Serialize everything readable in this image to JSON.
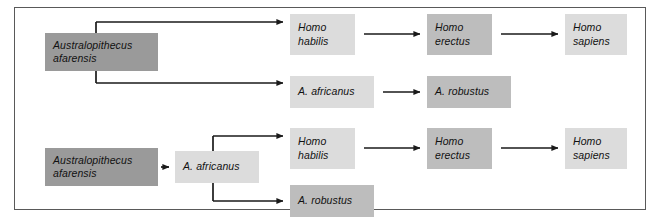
{
  "figure": {
    "caption": "",
    "colors": {
      "frame_border": "#595959",
      "background": "#ffffff",
      "box_dark": "#9a9a9a",
      "box_mid": "#bdbdbd",
      "box_light": "#dcdcdc",
      "arrow": "#1a1a1a",
      "text": "#111111"
    }
  },
  "hypotheses": [
    {
      "id": "upper",
      "nodes": [
        {
          "id": "u-afarensis",
          "label": "Australopithecus\nafarensis",
          "shade": "dark",
          "x": 45,
          "y": 33,
          "w": 113,
          "h": 38
        },
        {
          "id": "u-habilis",
          "label": "Homo\nhabilis",
          "shade": "light",
          "x": 290,
          "y": 14,
          "w": 65,
          "h": 41
        },
        {
          "id": "u-erectus",
          "label": "Homo\nerectus",
          "shade": "mid",
          "x": 427,
          "y": 14,
          "w": 65,
          "h": 41
        },
        {
          "id": "u-sapiens",
          "label": "Homo\nsapiens",
          "shade": "light",
          "x": 565,
          "y": 14,
          "w": 62,
          "h": 41
        },
        {
          "id": "u-africanus",
          "label": "A. africanus",
          "shade": "light",
          "x": 290,
          "y": 76,
          "w": 84,
          "h": 32
        },
        {
          "id": "u-robustus",
          "label": "A. robustus",
          "shade": "mid",
          "x": 427,
          "y": 76,
          "w": 84,
          "h": 32
        }
      ],
      "edges": [
        {
          "from": "u-afarensis",
          "to": "u-habilis",
          "style": "bracket-up"
        },
        {
          "from": "u-afarensis",
          "to": "u-africanus",
          "style": "bracket-down"
        },
        {
          "from": "u-habilis",
          "to": "u-erectus",
          "style": "straight"
        },
        {
          "from": "u-erectus",
          "to": "u-sapiens",
          "style": "straight"
        },
        {
          "from": "u-africanus",
          "to": "u-robustus",
          "style": "straight"
        }
      ]
    },
    {
      "id": "lower",
      "nodes": [
        {
          "id": "l-afarensis",
          "label": "Australopithecus\nafarensis",
          "shade": "dark",
          "x": 45,
          "y": 148,
          "w": 113,
          "h": 38
        },
        {
          "id": "l-africanus",
          "label": "A. africanus",
          "shade": "light",
          "x": 175,
          "y": 151,
          "w": 84,
          "h": 32
        },
        {
          "id": "l-habilis",
          "label": "Homo\nhabilis",
          "shade": "light",
          "x": 290,
          "y": 128,
          "w": 65,
          "h": 41
        },
        {
          "id": "l-erectus",
          "label": "Homo\nerectus",
          "shade": "mid",
          "x": 427,
          "y": 128,
          "w": 65,
          "h": 41
        },
        {
          "id": "l-sapiens",
          "label": "Homo\nsapiens",
          "shade": "light",
          "x": 565,
          "y": 128,
          "w": 62,
          "h": 41
        },
        {
          "id": "l-robustus",
          "label": "A. robustus",
          "shade": "mid",
          "x": 290,
          "y": 185,
          "w": 84,
          "h": 32
        }
      ],
      "edges": [
        {
          "from": "l-afarensis",
          "to": "l-africanus",
          "style": "short"
        },
        {
          "from": "l-africanus",
          "to": "l-habilis",
          "style": "bracket-up"
        },
        {
          "from": "l-africanus",
          "to": "l-robustus",
          "style": "bracket-down"
        },
        {
          "from": "l-habilis",
          "to": "l-erectus",
          "style": "straight"
        },
        {
          "from": "l-erectus",
          "to": "l-sapiens",
          "style": "straight"
        }
      ]
    }
  ],
  "labels": {
    "afarensis": "Australopithecus\nafarensis",
    "africanus": "A. africanus",
    "robustus": "A. robustus",
    "habilis": "Homo\nhabilis",
    "erectus": "Homo\nerectus",
    "sapiens": "Homo\nsapiens"
  }
}
